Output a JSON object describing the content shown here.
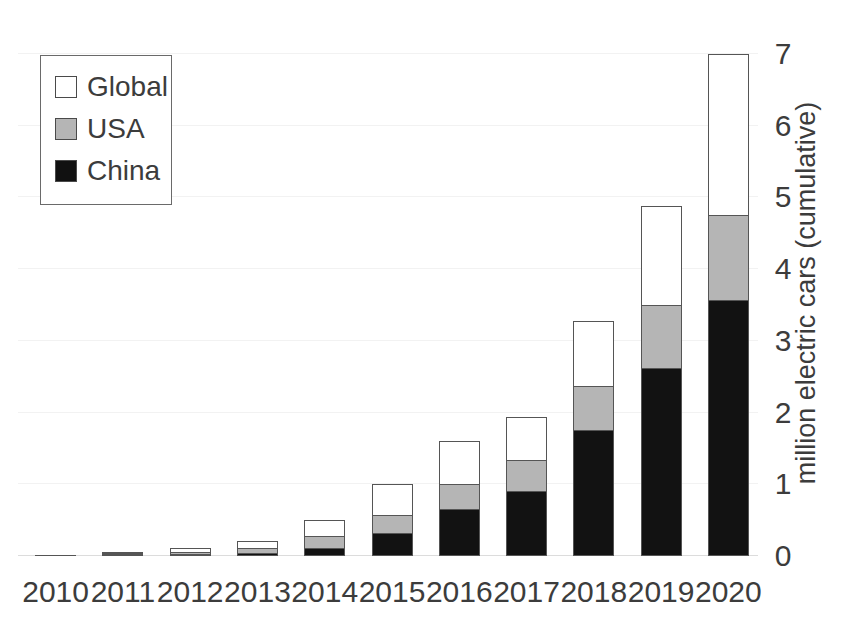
{
  "chart_data": {
    "type": "bar",
    "subtype": "stacked-bar",
    "title": "",
    "xlabel": "",
    "ylabel": "million electric cars (cumulative)",
    "ylim": [
      0,
      7
    ],
    "yticks": [
      0,
      1,
      2,
      3,
      4,
      5,
      6,
      7
    ],
    "ytick_labels": [
      "0",
      "1",
      "2",
      "3",
      "4",
      "5",
      "6",
      "7"
    ],
    "grid": true,
    "grid_axis": "y",
    "legend_position": "upper left",
    "categories": [
      "2010",
      "2011",
      "2012",
      "2013",
      "2014",
      "2015",
      "2016",
      "2017",
      "2018",
      "2019",
      "2020"
    ],
    "series": [
      {
        "name": "China",
        "color": "#121212",
        "values": [
          0.0,
          0.01,
          0.02,
          0.04,
          0.11,
          0.32,
          0.65,
          0.91,
          1.76,
          2.62,
          3.57
        ]
      },
      {
        "name": "USA",
        "color": "#b5b5b5",
        "values": [
          0.0,
          0.01,
          0.03,
          0.07,
          0.17,
          0.25,
          0.35,
          0.43,
          0.61,
          0.88,
          1.19
        ]
      },
      {
        "name": "Global",
        "color": "#ffffff",
        "values": [
          0.01,
          0.02,
          0.06,
          0.1,
          0.22,
          0.43,
          0.61,
          0.6,
          0.91,
          1.38,
          2.24
        ]
      }
    ],
    "totals": [
      0.01,
      0.04,
      0.11,
      0.21,
      0.5,
      1.0,
      1.61,
      1.94,
      3.28,
      4.88,
      7.0
    ],
    "stack_order": [
      "China",
      "USA",
      "Global"
    ]
  },
  "legend": {
    "items": [
      {
        "label": "Global",
        "swatch": "white-square-swatch"
      },
      {
        "label": "USA",
        "swatch": "gray-square-swatch"
      },
      {
        "label": "China",
        "swatch": "black-square-swatch"
      }
    ]
  },
  "colors": {
    "china": "#121212",
    "usa": "#b5b5b5",
    "global": "#ffffff",
    "outline": "#555555",
    "text": "#3c3c3c",
    "gridline": "#f2f2f2",
    "background": "#ffffff"
  }
}
